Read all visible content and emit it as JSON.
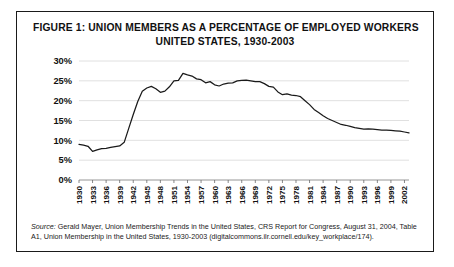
{
  "figure": {
    "title_line_1": "FIGURE 1: UNION MEMBERS AS A PERCENTAGE OF EMPLOYED WORKERS",
    "title_line_2": "UNITED STATES, 1930-2003",
    "source_label": "Source:",
    "source_body": " Gerald Mayer, Union Membership Trends in the United States, CRS Report for Congress, August 31, 2004, Table A1, Union Membership in the United States, 1930-2003 (digitalcommons.ilr.cornell.edu/key_workplace/174)."
  },
  "chart_data": {
    "type": "line",
    "title": "FIGURE 1: UNION MEMBERS AS A PERCENTAGE OF EMPLOYED WORKERS UNITED STATES, 1930-2003",
    "xlabel": "",
    "ylabel": "",
    "xlim": [
      1930,
      2003
    ],
    "ylim": [
      0,
      30
    ],
    "grid": true,
    "legend": "none",
    "line_color": "#1a1a1a",
    "ytick_labels": [
      "0%",
      "5%",
      "10%",
      "15%",
      "20%",
      "25%",
      "30%"
    ],
    "ytick_values": [
      0,
      5,
      10,
      15,
      20,
      25,
      30
    ],
    "xtick_labels": [
      "1930",
      "1933",
      "1936",
      "1939",
      "1942",
      "1945",
      "1948",
      "1951",
      "1954",
      "1957",
      "1960",
      "1963",
      "1966",
      "1969",
      "1972",
      "1975",
      "1978",
      "1981",
      "1984",
      "1987",
      "1990",
      "1993",
      "1996",
      "1999",
      "2002"
    ],
    "xtick_values": [
      1930,
      1933,
      1936,
      1939,
      1942,
      1945,
      1948,
      1951,
      1954,
      1957,
      1960,
      1963,
      1966,
      1969,
      1972,
      1975,
      1978,
      1981,
      1984,
      1987,
      1990,
      1993,
      1996,
      1999,
      2002
    ],
    "x": [
      1930,
      1931,
      1932,
      1933,
      1934,
      1935,
      1936,
      1937,
      1938,
      1939,
      1940,
      1941,
      1942,
      1943,
      1944,
      1945,
      1946,
      1947,
      1948,
      1949,
      1950,
      1951,
      1952,
      1953,
      1954,
      1955,
      1956,
      1957,
      1958,
      1959,
      1960,
      1961,
      1962,
      1963,
      1964,
      1965,
      1966,
      1967,
      1968,
      1969,
      1970,
      1971,
      1972,
      1973,
      1974,
      1975,
      1976,
      1977,
      1978,
      1979,
      1980,
      1981,
      1982,
      1983,
      1984,
      1985,
      1986,
      1987,
      1988,
      1989,
      1990,
      1991,
      1992,
      1993,
      1994,
      1995,
      1996,
      1997,
      1998,
      1999,
      2000,
      2001,
      2002,
      2003
    ],
    "y": [
      9.0,
      8.8,
      8.5,
      7.2,
      7.6,
      7.9,
      8.0,
      8.2,
      8.4,
      8.6,
      9.5,
      13.0,
      16.5,
      19.8,
      22.4,
      23.2,
      23.6,
      23.0,
      22.1,
      22.4,
      23.5,
      25.0,
      25.1,
      26.9,
      26.5,
      26.2,
      25.5,
      25.3,
      24.5,
      24.8,
      24.0,
      23.7,
      24.2,
      24.4,
      24.5,
      25.0,
      25.1,
      25.2,
      25.0,
      24.8,
      24.8,
      24.3,
      23.6,
      23.4,
      22.2,
      21.5,
      21.7,
      21.4,
      21.3,
      21.0,
      20.0,
      19.0,
      17.8,
      17.0,
      16.2,
      15.5,
      15.0,
      14.5,
      14.0,
      13.8,
      13.5,
      13.2,
      13.0,
      12.8,
      12.9,
      12.8,
      12.7,
      12.6,
      12.6,
      12.5,
      12.4,
      12.3,
      12.1,
      11.9
    ]
  }
}
